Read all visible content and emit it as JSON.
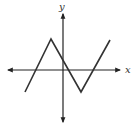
{
  "diagram": {
    "type": "function-graph",
    "x_axis_label": "x",
    "y_axis_label": "y",
    "colors": {
      "axis": "#222222",
      "curve": "#333333",
      "label": "#333333",
      "background": "#ffffff"
    },
    "curve_vertices_px": [
      [
        25,
        92
      ],
      [
        51,
        39
      ],
      [
        81,
        92
      ],
      [
        110,
        40
      ]
    ],
    "axes_origin_px": [
      63,
      70
    ]
  }
}
